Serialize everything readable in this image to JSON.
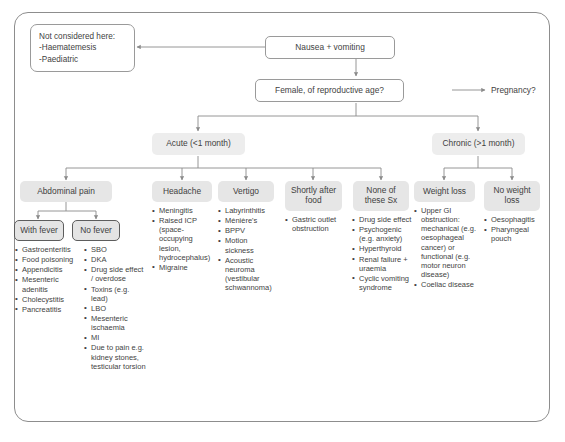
{
  "diagram": {
    "colors": {
      "node_fill": "#e6e6e6",
      "frame_border": "#8d8d8d",
      "text": "#3f3f3f",
      "connector": "#8a8a8a",
      "strong_border": "#5d5d5d"
    },
    "exclusion_note": {
      "heading": "Not considered here:",
      "items": [
        "-Haematemesis",
        "-Paediatric"
      ]
    },
    "root": {
      "label": "Nausea + vomiting"
    },
    "decision": {
      "label": "Female, of reproductive age?"
    },
    "side_outcome": {
      "label": "Pregnancy?"
    },
    "branches": [
      {
        "label": "Acute (<1 month)"
      },
      {
        "label": "Chronic (>1 month)"
      }
    ],
    "categories": [
      {
        "id": "abdominal-pain",
        "label": "Abdominal pain",
        "subcategories": [
          {
            "id": "with-fever",
            "label": "With fever",
            "items": [
              "Gastroenteritis",
              "Food poisoning",
              "Appendicitis",
              "Mesenteric adenitis",
              "Cholecystitis",
              "Pancreatitis"
            ]
          },
          {
            "id": "no-fever",
            "label": "No fever",
            "items": [
              "SBO",
              "DKA",
              "Drug side effect / overdose",
              "Toxins (e.g. lead)",
              "LBO",
              "Mesenteric ischaemia",
              "MI",
              "Due to pain e.g. kidney stones, testicular torsion"
            ]
          }
        ]
      },
      {
        "id": "headache",
        "label": "Headache",
        "items": [
          "Meningitis",
          "Raised ICP (space-occupying lesion, hydrocephalus)",
          "Migraine"
        ]
      },
      {
        "id": "vertigo",
        "label": "Vertigo",
        "items": [
          "Labyrinthitis",
          "Ménière's",
          "BPPV",
          "Motion sickness",
          "Acoustic neuroma (vestibular schwannoma)"
        ]
      },
      {
        "id": "shortly-after-food",
        "label": "Shortly after food",
        "items": [
          "Gastric outlet obstruction"
        ]
      },
      {
        "id": "none-of-these-sx",
        "label": "None of these Sx",
        "items": [
          "Drug side effect",
          "Psychogenic (e.g. anxiety)",
          "Hyperthyroid",
          "Renal failure + uraemia",
          "Cyclic vomiting syndrome"
        ]
      },
      {
        "id": "weight-loss",
        "label": "Weight loss",
        "items": [
          "Upper GI obstruction: mechanical (e.g. oesophageal cancer) or functional (e.g. motor neuron disease)",
          "Coeliac disease"
        ]
      },
      {
        "id": "no-weight-loss",
        "label": "No weight loss",
        "items": [
          "Oesophagitis",
          "Pharyngeal pouch"
        ]
      }
    ]
  }
}
